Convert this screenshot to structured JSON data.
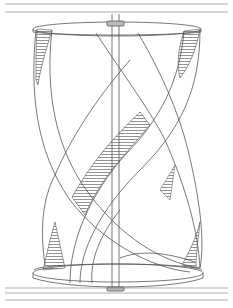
{
  "figure": {
    "style": "patent line art with horizontal hatching on blade undersides",
    "colors": {
      "background": "#ffffff",
      "line": "#555555",
      "hub": "#bbbbbb"
    },
    "components": [
      "top-rail",
      "top-disc",
      "top-hub",
      "shaft",
      "helical-blade-1",
      "helical-blade-2",
      "bottom-disc",
      "bottom-hub",
      "bottom-rail"
    ]
  }
}
